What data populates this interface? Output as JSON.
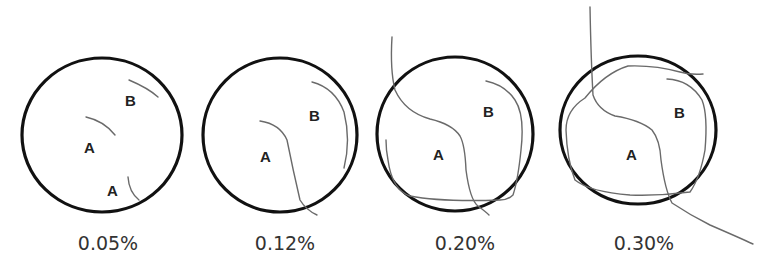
{
  "panels": [
    {
      "caption": "0.05%",
      "labels": [
        "A",
        "B",
        "A"
      ]
    },
    {
      "caption": "0.12%",
      "labels": [
        "A",
        "B"
      ]
    },
    {
      "caption": "0.20%",
      "labels": [
        "A",
        "B"
      ]
    },
    {
      "caption": "0.30%",
      "labels": [
        "A",
        "B"
      ]
    }
  ],
  "colors": {
    "outline": "#111111",
    "crack": "#6a6a6a",
    "text": "#222222"
  }
}
